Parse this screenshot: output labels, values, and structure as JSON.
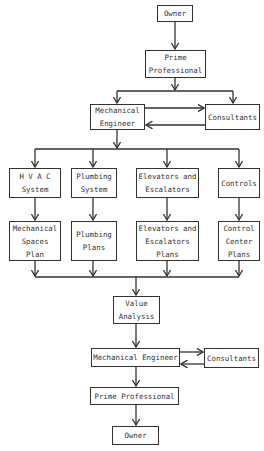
{
  "diagram": {
    "type": "flowchart",
    "nodes": {
      "owner_top": "Owner",
      "prime_top": "Prime\nProfessional",
      "mech_top": "Mechanical\nEngineer",
      "consult_top": "Consultants",
      "hvac": "H V A C\nSystem",
      "plumbing_sys": "Plumbing\nSystem",
      "elevators_sys": "Elevators and\nEscalators",
      "controls": "Controls",
      "mech_spaces": "Mechanical\nSpaces\nPlan",
      "plumbing_plans": "Plumbing\nPlans",
      "elevators_plans": "Elevators and\nEscalators\nPlans",
      "control_center": "Control\nCenter\nPlans",
      "value_analysis": "Value\nAnalysis",
      "mech_bottom": "Mechanical Engineer",
      "consult_bottom": "Consultants",
      "prime_bottom": "Prime Professional",
      "owner_bottom": "Owner"
    },
    "edges": [
      [
        "owner_top",
        "prime_top"
      ],
      [
        "prime_top",
        "mech_top"
      ],
      [
        "prime_top",
        "consult_top"
      ],
      [
        "mech_top",
        "consult_top"
      ],
      [
        "consult_top",
        "mech_top"
      ],
      [
        "mech_top",
        "hvac"
      ],
      [
        "mech_top",
        "plumbing_sys"
      ],
      [
        "mech_top",
        "elevators_sys"
      ],
      [
        "mech_top",
        "controls"
      ],
      [
        "hvac",
        "mech_spaces"
      ],
      [
        "plumbing_sys",
        "plumbing_plans"
      ],
      [
        "elevators_sys",
        "elevators_plans"
      ],
      [
        "controls",
        "control_center"
      ],
      [
        "mech_spaces",
        "value_analysis"
      ],
      [
        "plumbing_plans",
        "value_analysis"
      ],
      [
        "elevators_plans",
        "value_analysis"
      ],
      [
        "control_center",
        "value_analysis"
      ],
      [
        "value_analysis",
        "mech_bottom"
      ],
      [
        "mech_bottom",
        "consult_bottom"
      ],
      [
        "consult_bottom",
        "mech_bottom"
      ],
      [
        "mech_bottom",
        "prime_bottom"
      ],
      [
        "prime_bottom",
        "owner_bottom"
      ]
    ]
  }
}
